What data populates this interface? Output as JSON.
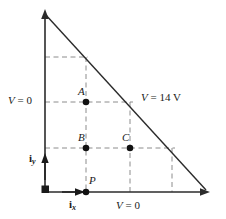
{
  "figure": {
    "background_color": "#ffffff",
    "line_color": "#2b2b2b",
    "dash_color": "#8c8c8c",
    "width": 226,
    "height": 219
  },
  "labels": {
    "point_a": "A",
    "point_b": "B",
    "point_c": "C",
    "point_p": "P",
    "v_left": "V = 0",
    "v_left_symbol": "V",
    "v_left_value": "= 0",
    "v_hyp": "V = 14 V",
    "v_hyp_symbol": "V",
    "v_hyp_value": "= 14 V",
    "v_bottom": "V = 0",
    "v_bottom_symbol": "V",
    "v_bottom_value": "= 0",
    "basis_x": "i",
    "basis_x_sub": "x",
    "basis_y": "i",
    "basis_y_sub": "y"
  },
  "geometry": {
    "origin": {
      "x": 45,
      "y": 192
    },
    "y_axis_tip": {
      "x": 45,
      "y": 11
    },
    "x_axis_right": {
      "x": 208,
      "y": 192
    },
    "grid_step_x": 41,
    "grid_step_y": 45,
    "points": {
      "A": {
        "x": 86,
        "y": 102
      },
      "B": {
        "x": 86,
        "y": 148
      },
      "C": {
        "x": 130,
        "y": 148
      },
      "P": {
        "x": 86,
        "y": 192
      }
    },
    "dashed_horizontals_y": [
      57,
      102,
      148
    ],
    "dashed_verticals_x": [
      86,
      130,
      172
    ]
  }
}
